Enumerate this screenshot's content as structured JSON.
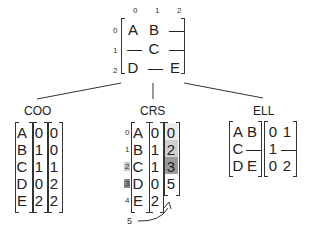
{
  "dense_matrix": {
    "col_indices": [
      "0",
      "1",
      "2"
    ],
    "row_indices": [
      "0",
      "1",
      "2"
    ],
    "rows": [
      [
        "A",
        "B",
        "—"
      ],
      [
        "—",
        "C",
        "—"
      ],
      [
        "D",
        "—",
        "E"
      ]
    ]
  },
  "coo": {
    "title": "COO",
    "values": [
      "A",
      "B",
      "C",
      "D",
      "E"
    ],
    "rows": [
      "0",
      "1",
      "1",
      "0",
      "2"
    ],
    "cols": [
      "0",
      "0",
      "1",
      "2",
      "2"
    ]
  },
  "crs": {
    "title": "CRS",
    "index_labels": [
      "0",
      "1",
      "2",
      "3",
      "4"
    ],
    "values": [
      "A",
      "B",
      "C",
      "D",
      "E"
    ],
    "col_idx": [
      "0",
      "1",
      "1",
      "0",
      "2"
    ],
    "row_ptr": [
      "0",
      "2",
      "3",
      "5"
    ],
    "end_label": "5",
    "highlight_colors": [
      "#e8e8e8",
      "#c8c8c8",
      "#9a9a9a",
      "#ffffff"
    ]
  },
  "ell": {
    "title": "ELL",
    "values": [
      [
        "A",
        "B"
      ],
      [
        "C",
        "—"
      ],
      [
        "D",
        "E"
      ]
    ],
    "indices": [
      [
        "0",
        "1"
      ],
      [
        "1",
        "—"
      ],
      [
        "0",
        "2"
      ]
    ]
  }
}
